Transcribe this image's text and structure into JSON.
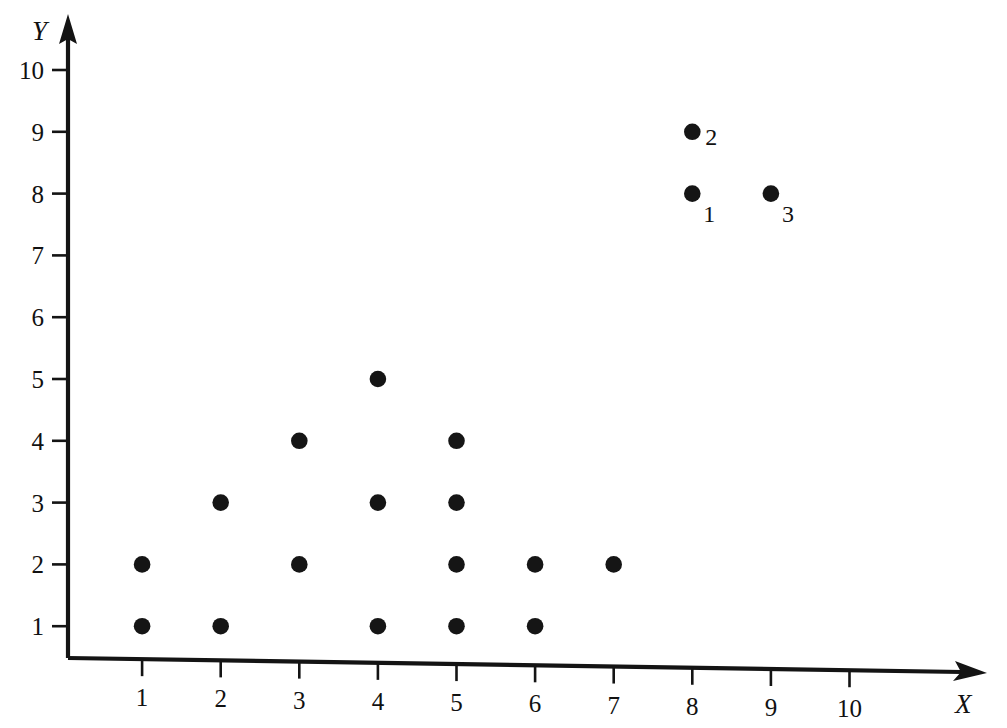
{
  "chart_data": {
    "type": "scatter",
    "title": "",
    "subtitle": "",
    "xlabel": "X",
    "ylabel": "Y",
    "xlim": [
      0,
      11
    ],
    "ylim": [
      0,
      11
    ],
    "grid": false,
    "legend": false,
    "x_ticks": [
      1,
      2,
      3,
      4,
      5,
      6,
      7,
      8,
      9,
      10
    ],
    "y_ticks": [
      1,
      2,
      3,
      4,
      5,
      6,
      7,
      8,
      9,
      10
    ],
    "x_tick_labels": [
      "1",
      "2",
      "3",
      "4",
      "5",
      "6",
      "7",
      "8",
      "9",
      "10"
    ],
    "y_tick_labels": [
      "1",
      "2",
      "3",
      "4",
      "5",
      "6",
      "7",
      "8",
      "9",
      "10"
    ],
    "points": [
      {
        "x": 1,
        "y": 1,
        "label": ""
      },
      {
        "x": 1,
        "y": 2,
        "label": ""
      },
      {
        "x": 2,
        "y": 1,
        "label": ""
      },
      {
        "x": 2,
        "y": 3,
        "label": ""
      },
      {
        "x": 3,
        "y": 2,
        "label": ""
      },
      {
        "x": 3,
        "y": 4,
        "label": ""
      },
      {
        "x": 4,
        "y": 1,
        "label": ""
      },
      {
        "x": 4,
        "y": 3,
        "label": ""
      },
      {
        "x": 4,
        "y": 5,
        "label": ""
      },
      {
        "x": 5,
        "y": 1,
        "label": ""
      },
      {
        "x": 5,
        "y": 2,
        "label": ""
      },
      {
        "x": 5,
        "y": 3,
        "label": ""
      },
      {
        "x": 5,
        "y": 4,
        "label": ""
      },
      {
        "x": 6,
        "y": 1,
        "label": ""
      },
      {
        "x": 6,
        "y": 2,
        "label": ""
      },
      {
        "x": 7,
        "y": 2,
        "label": ""
      },
      {
        "x": 8,
        "y": 8,
        "label": "1",
        "label_pos": "below-right"
      },
      {
        "x": 8,
        "y": 9,
        "label": "2",
        "label_pos": "right"
      },
      {
        "x": 9,
        "y": 8,
        "label": "3",
        "label_pos": "below-right"
      }
    ],
    "annotations": [
      {
        "text": "1",
        "x": 8,
        "y": 8
      },
      {
        "text": "2",
        "x": 8,
        "y": 9
      },
      {
        "text": "3",
        "x": 9,
        "y": 8
      }
    ],
    "colors": {
      "background": "#ffffff",
      "axis": "#141414",
      "point": "#151515",
      "text": "#111111"
    }
  },
  "axes": {
    "x_axis_name": "X",
    "y_axis_name": "Y"
  }
}
